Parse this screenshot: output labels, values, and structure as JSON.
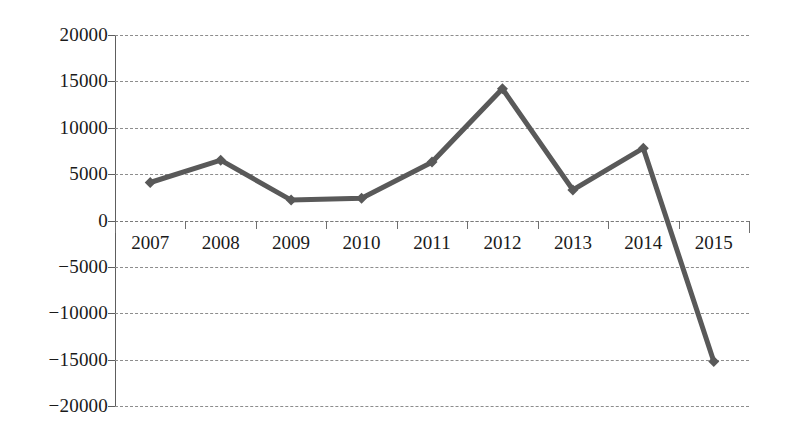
{
  "chart_data": {
    "type": "line",
    "title": "",
    "subtitle": "",
    "xlabel": "",
    "ylabel": "",
    "categories": [
      "2007",
      "2008",
      "2009",
      "2010",
      "2011",
      "2012",
      "2013",
      "2014",
      "2015"
    ],
    "values": [
      4100,
      6500,
      2200,
      2400,
      6300,
      14200,
      3300,
      7800,
      -15200
    ],
    "series": [
      {
        "name": "Series 1",
        "values": [
          4100,
          6500,
          2200,
          2400,
          6300,
          14200,
          3300,
          7800,
          -15200
        ],
        "color": "#595959",
        "marker": "diamond",
        "line_width": 5
      }
    ],
    "ylim": [
      -20000,
      20000
    ],
    "ytick_values": [
      20000,
      15000,
      10000,
      5000,
      0,
      -5000,
      -10000,
      -15000,
      -20000
    ],
    "ytick_labels": [
      "20000",
      "15000",
      "10000",
      "5000",
      "0",
      "−5000",
      "−10000",
      "−15000",
      "−20000"
    ],
    "grid": true,
    "grid_axis": "y",
    "grid_style": "dashed",
    "grid_color": "#8d8d8d",
    "legend": false,
    "legend_position": "none",
    "axis_color": "#5e5e5e",
    "background": "#ffffff",
    "category_axis_at_zero": true
  }
}
